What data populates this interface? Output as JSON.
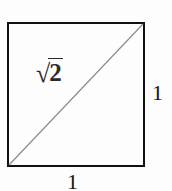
{
  "figure": {
    "name": "unit-square-with-diagonal",
    "background_color": "#fdfdfd",
    "square": {
      "stroke_color": "#111111",
      "stroke_width": 2,
      "fill": "none"
    },
    "diagonal": {
      "stroke_color": "#8c8c8c",
      "stroke_width": 1.2,
      "from": "bottom-left",
      "to": "top-right"
    },
    "labels": {
      "hypotenuse": {
        "radical_symbol": "√",
        "radicand": "2",
        "full_text": "√2"
      },
      "right_side": "1",
      "bottom_side": "1"
    }
  }
}
